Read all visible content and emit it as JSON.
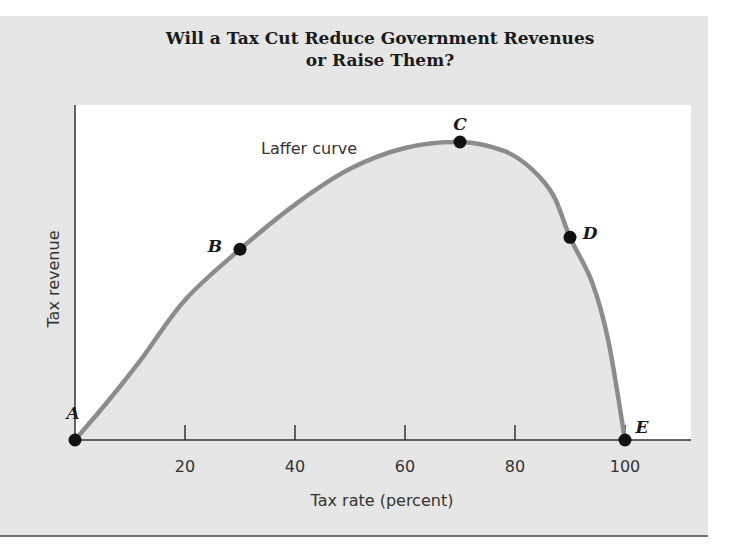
{
  "title": {
    "line1": "Will a Tax Cut Reduce Government Revenues",
    "line2": "or Raise Them?"
  },
  "colors": {
    "panel_bg": "#e6e6e6",
    "plot_bg": "#ffffff",
    "under_curve_fill": "#e6e6e6",
    "curve": "#8c8c8c",
    "axis": "#333333",
    "point": "#111111"
  },
  "chart_data": {
    "type": "line",
    "title": "Will a Tax Cut Reduce Government Revenues or Raise Them?",
    "xlabel": "Tax rate (percent)",
    "ylabel": "Tax revenue",
    "xlim": [
      0,
      112
    ],
    "ylim": [
      0,
      112
    ],
    "x_ticks": [
      20,
      40,
      60,
      80,
      100
    ],
    "y_ticks": [],
    "grid": false,
    "legend": null,
    "series": [
      {
        "name": "Laffer curve",
        "x": [
          0,
          6,
          12,
          20,
          30,
          40,
          50,
          60,
          70,
          78,
          83,
          87,
          90,
          94,
          97,
          100
        ],
        "values": [
          0,
          13,
          27,
          47,
          64,
          79,
          91,
          98,
          100,
          97,
          91,
          82,
          68,
          53,
          33,
          0
        ]
      }
    ],
    "points": [
      {
        "label": "A",
        "x": 0,
        "y": 0
      },
      {
        "label": "B",
        "x": 30,
        "y": 64
      },
      {
        "label": "C",
        "x": 70,
        "y": 100
      },
      {
        "label": "D",
        "x": 90,
        "y": 68
      },
      {
        "label": "E",
        "x": 100,
        "y": 0
      }
    ],
    "annotations": [
      {
        "text": "Laffer curve",
        "x": 34,
        "y": 97
      }
    ]
  }
}
